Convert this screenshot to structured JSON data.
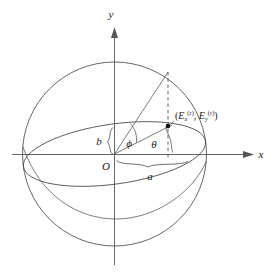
{
  "figure": {
    "type": "diagram",
    "background_color": "#ffffff",
    "line_color": "#4a4a4a",
    "axis_color": "#555555",
    "text_color": "#1a1a1a"
  },
  "axes": {
    "x_label": "x",
    "y_label": "y",
    "origin_label": "O",
    "x_arrow": "arrow-right",
    "y_arrow": "arrow-up"
  },
  "annotations": {
    "semi_major_label": "a",
    "semi_minor_label": "b",
    "angle_phi_label": "ϕ",
    "angle_theta_label": "θ",
    "point_label_open": "(",
    "point_label_ex": "E",
    "point_label_ex_sub": "x",
    "point_label_sup": "(r)",
    "point_label_comma": ", ",
    "point_label_ey": "E",
    "point_label_ey_sub": "y",
    "point_label_close": ")",
    "point_label_full": "(E_x^(r), E_y^(r))"
  },
  "geometry": {
    "sphere_center_x": 114.5,
    "sphere_center_y": 154,
    "sphere_radius": 92,
    "equator_semi_major": 92,
    "equator_semi_minor": 30,
    "equator_tilt_deg": -8,
    "point_x": 168,
    "point_y": 126,
    "surface_point_x": 168,
    "surface_point_y": 72
  }
}
